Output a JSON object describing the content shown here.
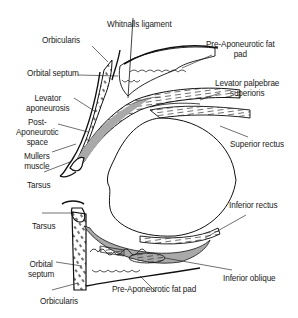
{
  "figure": {
    "colors": {
      "line": "#111111",
      "shade": "#a9a9a9",
      "text": "#222222",
      "background": "#ffffff"
    }
  },
  "labels": {
    "whitnalls_ligament": "Whitnalls ligament",
    "orbicularis_upper": "Orbicularis",
    "pre_aponeurotic_fat_pad_upper_1": "Pre-Aponeurotic fat",
    "pre_aponeurotic_fat_pad_upper_2": "pad",
    "orbital_septum_upper": "Orbital septum",
    "levator_palpebrae_1": "Levator palpebrae",
    "levator_palpebrae_2": "superioris",
    "levator_aponeurosis_1": "Levator",
    "levator_aponeurosis_2": "aponeurosis",
    "post_aponeurotic_1": "Post-",
    "post_aponeurotic_2": "Aponeurotic",
    "post_aponeurotic_3": "space",
    "superior_rectus": "Superior rectus",
    "mullers_1": "Mullers",
    "mullers_2": "muscle",
    "tarsus_upper": "Tarsus",
    "tarsus_lower": "Tarsus",
    "inferior_rectus": "Inferior rectus",
    "orbital_septum_lower_1": "Orbital",
    "orbital_septum_lower_2": "septum",
    "inferior_oblique": "Inferior oblique",
    "orbicularis_lower": "Orbicularis",
    "pre_aponeurotic_fat_pad_lower": "Pre-Aponeurotic fat pad"
  }
}
